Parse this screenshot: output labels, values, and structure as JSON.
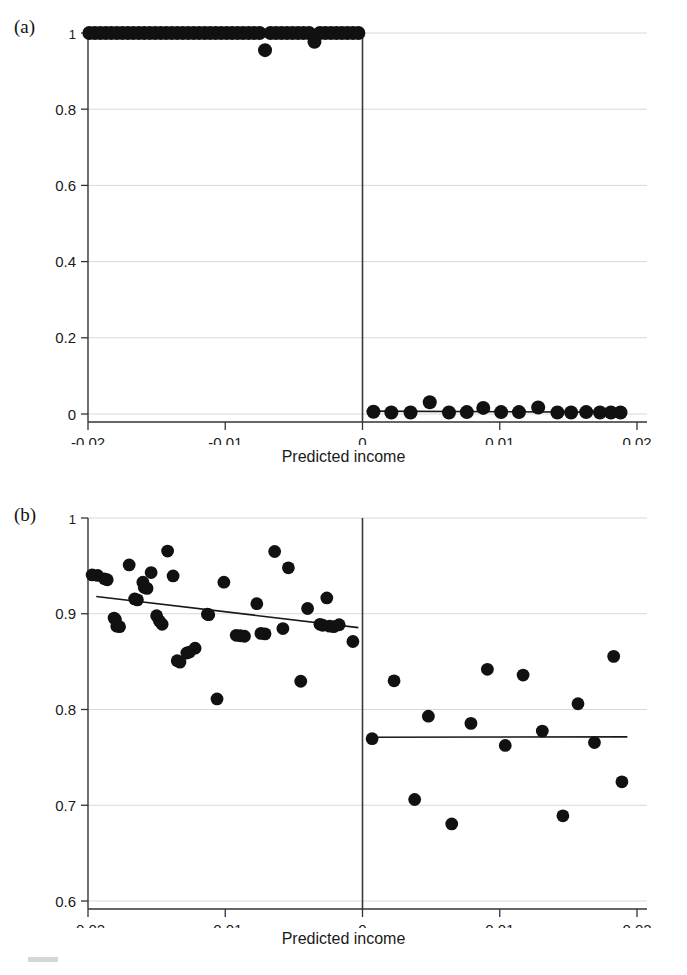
{
  "figure": {
    "panels": [
      {
        "id": "a",
        "label": "(a)",
        "xlabel": "Predicted income"
      },
      {
        "id": "b",
        "label": "(b)",
        "xlabel": "Predicted income"
      }
    ]
  },
  "chart_data": [
    {
      "type": "scatter",
      "panel": "a",
      "title": "",
      "xlabel": "Predicted income",
      "ylabel": "",
      "xlim": [
        -0.02,
        0.02
      ],
      "ylim": [
        0,
        1
      ],
      "xticks": [
        -0.02,
        -0.01,
        0,
        0.01,
        0.02
      ],
      "xticklabels": [
        "-0.02",
        "-0.01",
        "0",
        "0.01",
        "0.02"
      ],
      "yticks": [
        0,
        0.2,
        0.4,
        0.6,
        0.8,
        1
      ],
      "yticklabels": [
        "0",
        "0.2",
        "0.4",
        "0.6",
        "0.8",
        "1"
      ],
      "grid": true,
      "grid_axis": "y",
      "cutoff": 0,
      "cutoff_line": true,
      "legend": "none",
      "series": [
        {
          "name": "below-cutoff",
          "marker": "filled-circle",
          "color": "#111111",
          "points": [
            [
              -0.0199,
              1.0
            ],
            [
              -0.0195,
              1.0
            ],
            [
              -0.0191,
              1.0
            ],
            [
              -0.0187,
              1.0
            ],
            [
              -0.0183,
              1.0
            ],
            [
              -0.0179,
              1.0
            ],
            [
              -0.0175,
              1.0
            ],
            [
              -0.0171,
              1.0
            ],
            [
              -0.0167,
              1.0
            ],
            [
              -0.0163,
              1.0
            ],
            [
              -0.0159,
              1.0
            ],
            [
              -0.0155,
              1.0
            ],
            [
              -0.0151,
              1.0
            ],
            [
              -0.0147,
              1.0
            ],
            [
              -0.0143,
              1.0
            ],
            [
              -0.0139,
              1.0
            ],
            [
              -0.0135,
              1.0
            ],
            [
              -0.0131,
              1.0
            ],
            [
              -0.0127,
              1.0
            ],
            [
              -0.0123,
              1.0
            ],
            [
              -0.0119,
              1.0
            ],
            [
              -0.0115,
              1.0
            ],
            [
              -0.0111,
              1.0
            ],
            [
              -0.0107,
              1.0
            ],
            [
              -0.0103,
              1.0
            ],
            [
              -0.0099,
              1.0
            ],
            [
              -0.0095,
              1.0
            ],
            [
              -0.0091,
              1.0
            ],
            [
              -0.0087,
              1.0
            ],
            [
              -0.0083,
              1.0
            ],
            [
              -0.0079,
              1.0
            ],
            [
              -0.0075,
              1.0
            ],
            [
              -0.0071,
              0.955
            ],
            [
              -0.0067,
              1.0
            ],
            [
              -0.0063,
              1.0
            ],
            [
              -0.0059,
              1.0
            ],
            [
              -0.0055,
              1.0
            ],
            [
              -0.0051,
              1.0
            ],
            [
              -0.0047,
              1.0
            ],
            [
              -0.0043,
              1.0
            ],
            [
              -0.0039,
              1.0
            ],
            [
              -0.0035,
              0.977
            ],
            [
              -0.0031,
              1.0
            ],
            [
              -0.0027,
              1.0
            ],
            [
              -0.0023,
              1.0
            ],
            [
              -0.0019,
              1.0
            ],
            [
              -0.0015,
              1.0
            ],
            [
              -0.0011,
              1.0
            ],
            [
              -0.0007,
              1.0
            ],
            [
              -0.0003,
              1.0
            ]
          ]
        },
        {
          "name": "above-cutoff",
          "marker": "filled-circle",
          "color": "#111111",
          "points": [
            [
              0.0008,
              0.006
            ],
            [
              0.0021,
              0.004
            ],
            [
              0.0035,
              0.004
            ],
            [
              0.0049,
              0.031
            ],
            [
              0.0063,
              0.004
            ],
            [
              0.0076,
              0.005
            ],
            [
              0.0088,
              0.016
            ],
            [
              0.0101,
              0.005
            ],
            [
              0.0114,
              0.005
            ],
            [
              0.0128,
              0.017
            ],
            [
              0.0142,
              0.004
            ],
            [
              0.0152,
              0.004
            ],
            [
              0.0163,
              0.005
            ],
            [
              0.0173,
              0.004
            ],
            [
              0.0181,
              0.004
            ],
            [
              0.0188,
              0.004
            ]
          ]
        }
      ],
      "fit_lines": [
        {
          "name": "left-fit",
          "x": [
            -0.0199,
            -0.0002
          ],
          "y": [
            1.0,
            1.0
          ]
        },
        {
          "name": "right-fit",
          "x": [
            0.0003,
            0.0192
          ],
          "y": [
            0.0075,
            0.0045
          ]
        }
      ]
    },
    {
      "type": "scatter",
      "panel": "b",
      "title": "",
      "xlabel": "Predicted income",
      "ylabel": "",
      "xlim": [
        -0.02,
        0.02
      ],
      "ylim": [
        0.6,
        1.0
      ],
      "xticks": [
        -0.02,
        -0.01,
        0,
        0.01,
        0.02
      ],
      "xticklabels": [
        "-0.02",
        "-0.01",
        "0",
        "0.01",
        "0.02"
      ],
      "yticks": [
        0.6,
        0.7,
        0.8,
        0.9,
        1.0
      ],
      "yticklabels": [
        "0.6",
        "0.7",
        "0.8",
        "0.9",
        "1"
      ],
      "grid": true,
      "grid_axis": "y",
      "cutoff": 0,
      "cutoff_line": true,
      "legend": "none",
      "series": [
        {
          "name": "below-cutoff",
          "marker": "filled-circle",
          "color": "#111111",
          "points": [
            [
              -0.0197,
              0.9405
            ],
            [
              -0.0193,
              0.94
            ],
            [
              -0.0188,
              0.9365
            ],
            [
              -0.0186,
              0.9355
            ],
            [
              -0.0181,
              0.8955
            ],
            [
              -0.018,
              0.894
            ],
            [
              -0.0179,
              0.887
            ],
            [
              -0.0177,
              0.8865
            ],
            [
              -0.017,
              0.951
            ],
            [
              -0.0166,
              0.9155
            ],
            [
              -0.0164,
              0.9145
            ],
            [
              -0.016,
              0.933
            ],
            [
              -0.0159,
              0.9275
            ],
            [
              -0.0157,
              0.9265
            ],
            [
              -0.0154,
              0.943
            ],
            [
              -0.015,
              0.898
            ],
            [
              -0.0148,
              0.8925
            ],
            [
              -0.0146,
              0.889
            ],
            [
              -0.0142,
              0.9655
            ],
            [
              -0.0138,
              0.9395
            ],
            [
              -0.0135,
              0.851
            ],
            [
              -0.0133,
              0.8495
            ],
            [
              -0.0128,
              0.859
            ],
            [
              -0.0126,
              0.86
            ],
            [
              -0.0122,
              0.864
            ],
            [
              -0.0113,
              0.8995
            ],
            [
              -0.0112,
              0.899
            ],
            [
              -0.0106,
              0.811
            ],
            [
              -0.0101,
              0.933
            ],
            [
              -0.0092,
              0.8775
            ],
            [
              -0.0089,
              0.877
            ],
            [
              -0.0086,
              0.8765
            ],
            [
              -0.0077,
              0.9105
            ],
            [
              -0.0074,
              0.8795
            ],
            [
              -0.0071,
              0.879
            ],
            [
              -0.0064,
              0.965
            ],
            [
              -0.0058,
              0.8845
            ],
            [
              -0.0054,
              0.948
            ],
            [
              -0.0045,
              0.8295
            ],
            [
              -0.004,
              0.9055
            ],
            [
              -0.0031,
              0.889
            ],
            [
              -0.0029,
              0.888
            ],
            [
              -0.0026,
              0.9165
            ],
            [
              -0.0024,
              0.887
            ],
            [
              -0.0021,
              0.8865
            ],
            [
              -0.0017,
              0.8885
            ],
            [
              -0.0007,
              0.871
            ]
          ]
        },
        {
          "name": "above-cutoff",
          "marker": "filled-circle",
          "color": "#111111",
          "points": [
            [
              0.0007,
              0.7695
            ],
            [
              0.0023,
              0.83
            ],
            [
              0.0038,
              0.706
            ],
            [
              0.0048,
              0.793
            ],
            [
              0.0065,
              0.6805
            ],
            [
              0.0079,
              0.7855
            ],
            [
              0.0091,
              0.842
            ],
            [
              0.0104,
              0.7625
            ],
            [
              0.0117,
              0.836
            ],
            [
              0.0131,
              0.7775
            ],
            [
              0.0146,
              0.689
            ],
            [
              0.0157,
              0.806
            ],
            [
              0.0169,
              0.7655
            ],
            [
              0.0183,
              0.8555
            ],
            [
              0.0189,
              0.7245
            ]
          ]
        }
      ],
      "fit_lines": [
        {
          "name": "left-fit",
          "x": [
            -0.0194,
            -0.0003
          ],
          "y": [
            0.918,
            0.8855
          ]
        },
        {
          "name": "right-fit",
          "x": [
            0.0004,
            0.0193
          ],
          "y": [
            0.771,
            0.7715
          ]
        }
      ]
    }
  ]
}
